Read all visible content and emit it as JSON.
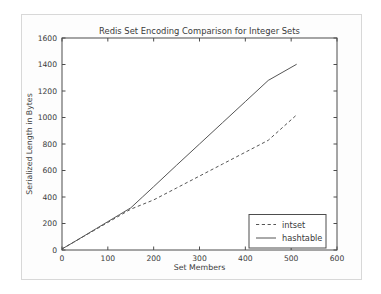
{
  "chart_data": {
    "type": "line",
    "title": "Redis Set Encoding Comparison for Integer Sets",
    "xlabel": "Set Members",
    "ylabel": "Serialized Length in Bytes",
    "xlim": [
      0,
      600
    ],
    "ylim": [
      0,
      1600
    ],
    "xticks": [
      0,
      100,
      200,
      300,
      400,
      500,
      600
    ],
    "yticks": [
      0,
      200,
      400,
      600,
      800,
      1000,
      1200,
      1400,
      1600
    ],
    "xtick_labels": [
      "0",
      "100",
      "200",
      "300",
      "400",
      "500",
      "600"
    ],
    "ytick_labels": [
      "0",
      "200",
      "400",
      "600",
      "800",
      "1000",
      "1200",
      "1400",
      "1600"
    ],
    "grid": false,
    "legend_position": "lower right",
    "x": [
      0,
      25,
      50,
      75,
      100,
      125,
      150,
      175,
      200,
      250,
      300,
      350,
      400,
      450,
      512
    ],
    "series": [
      {
        "name": "intset",
        "style": "dashed",
        "color": "#555555",
        "values": [
          8,
          58,
          108,
          158,
          208,
          258,
          308,
          343,
          378,
          468,
          558,
          648,
          738,
          828,
          1020
        ]
      },
      {
        "name": "hashtable",
        "style": "solid",
        "color": "#555555",
        "values": [
          8,
          58,
          110,
          162,
          214,
          266,
          318,
          398,
          478,
          640,
          800,
          960,
          1120,
          1280,
          1402
        ]
      }
    ]
  },
  "legend": {
    "entries": [
      {
        "label": "intset",
        "style": "dashed"
      },
      {
        "label": "hashtable",
        "style": "solid"
      }
    ]
  }
}
